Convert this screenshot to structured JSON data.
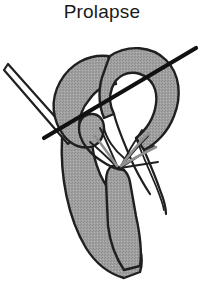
{
  "figure": {
    "title": "Prolapse",
    "type": "anatomical-line-drawing",
    "background_color": "#ffffff",
    "ink_color": "#1a1a1a",
    "tissue_fill_color": "#9d9d9d",
    "leaflet_fill_color": "#a3a3a3",
    "lumen_fill_color": "#ffffff",
    "annulus_line_color": "#111111",
    "parts": [
      {
        "name": "left-ballooning-leaflet",
        "label": "Left ballooning leaflet",
        "description": "Redundant mitral leaflet arching upward and bulging into the atrium"
      },
      {
        "name": "right-ballooning-leaflet",
        "label": "Right ballooning leaflet",
        "description": "Redundant mitral leaflet arching upward and bulging into the atrium"
      },
      {
        "name": "chordae-tendineae",
        "label": "Chordae tendineae",
        "description": "Thin fibrous strands fanning down from leaflet free edges to the papillary muscle"
      },
      {
        "name": "papillary-muscle",
        "label": "Papillary muscle",
        "description": "Shaded muscular column anchoring the chordae"
      },
      {
        "name": "ventricular-wall",
        "label": "Ventricular wall",
        "description": "Shaded V-shaped myocardial wall forming the lower chamber"
      },
      {
        "name": "annulus-reference-line",
        "label": "Annulus reference line",
        "description": "Thick straight black line marking the plane of the mitral annulus"
      },
      {
        "name": "probe-shaft",
        "label": "Probe shaft",
        "description": "Slender elongated instrument entering from the upper left"
      }
    ]
  }
}
